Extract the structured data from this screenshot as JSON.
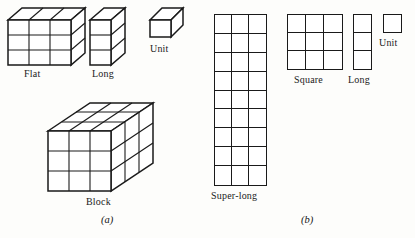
{
  "figure": {
    "background_color": "#fdfdfb",
    "line_color": "#1a1a1a",
    "fill_color": "#ffffff"
  },
  "panels": [
    {
      "id": "a",
      "caption": "(a)",
      "kind": "three-dimensional",
      "pieces": [
        {
          "name": "flat",
          "label": "Flat",
          "shape": "3d-box",
          "dims": {
            "width_units": 3,
            "height_units": 3,
            "depth_units": 1
          }
        },
        {
          "name": "long",
          "label": "Long",
          "shape": "3d-box",
          "dims": {
            "width_units": 1,
            "height_units": 3,
            "depth_units": 1
          }
        },
        {
          "name": "unit",
          "label": "Unit",
          "shape": "3d-box",
          "dims": {
            "width_units": 1,
            "height_units": 1,
            "depth_units": 1
          }
        },
        {
          "name": "block",
          "label": "Block",
          "shape": "3d-box",
          "dims": {
            "width_units": 3,
            "height_units": 3,
            "depth_units": 3
          }
        }
      ]
    },
    {
      "id": "b",
      "caption": "(b)",
      "kind": "two-dimensional",
      "pieces": [
        {
          "name": "super-long",
          "label": "Super-long",
          "shape": "2d-grid",
          "dims": {
            "cols": 3,
            "rows": 9
          }
        },
        {
          "name": "square",
          "label": "Square",
          "shape": "2d-grid",
          "dims": {
            "cols": 3,
            "rows": 3
          }
        },
        {
          "name": "long",
          "label": "Long",
          "shape": "2d-grid",
          "dims": {
            "cols": 1,
            "rows": 3
          }
        },
        {
          "name": "unit",
          "label": "Unit",
          "shape": "2d-grid",
          "dims": {
            "cols": 1,
            "rows": 1
          }
        }
      ]
    }
  ],
  "labels": {
    "a_flat": "Flat",
    "a_long": "Long",
    "a_unit": "Unit",
    "a_block": "Block",
    "a_caption": "(a)",
    "b_superlong": "Super-long",
    "b_square": "Square",
    "b_long": "Long",
    "b_unit": "Unit",
    "b_caption": "(b)"
  }
}
